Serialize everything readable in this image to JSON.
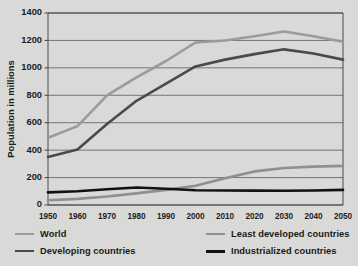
{
  "top_partial_title": "",
  "chart_data": {
    "type": "line",
    "title": "",
    "xlabel": "",
    "ylabel": "Population in millions",
    "x": [
      1950,
      1960,
      1970,
      1980,
      1990,
      2000,
      2010,
      2020,
      2030,
      2040,
      2050
    ],
    "xtick_labels": [
      "1950",
      "1960",
      "1970",
      "1980",
      "1990",
      "2000",
      "2010",
      "2020",
      "2030",
      "2040",
      "2050"
    ],
    "ytick_labels": [
      "0",
      "200",
      "400",
      "600",
      "800",
      "1000",
      "1200",
      "1400"
    ],
    "yticks": [
      0,
      200,
      400,
      600,
      800,
      1000,
      1200,
      1400
    ],
    "ylim": [
      0,
      1400
    ],
    "xlim": [
      1950,
      2050
    ],
    "grid": true,
    "legend_position": "bottom",
    "series": [
      {
        "name": "World",
        "color": "#9b9b9b",
        "width": 2.6,
        "values": [
          490,
          575,
          800,
          930,
          1050,
          1185,
          1200,
          1230,
          1265,
          1230,
          1190
        ]
      },
      {
        "name": "Developing countries",
        "color": "#4a4a4a",
        "width": 2.6,
        "values": [
          350,
          405,
          590,
          760,
          885,
          1010,
          1060,
          1100,
          1135,
          1105,
          1060
        ]
      },
      {
        "name": "Least developed countries",
        "color": "#8f8f8f",
        "width": 2.6,
        "values": [
          35,
          45,
          62,
          85,
          110,
          140,
          195,
          245,
          270,
          280,
          285
        ]
      },
      {
        "name": "Industrialized countries",
        "color": "#121212",
        "width": 2.6,
        "values": [
          92,
          100,
          115,
          128,
          118,
          108,
          106,
          105,
          104,
          106,
          110
        ]
      }
    ]
  },
  "legend": {
    "items": [
      {
        "label": "World",
        "color": "#9b9b9b"
      },
      {
        "label": "Least developed countries",
        "color": "#8f8f8f"
      },
      {
        "label": "Developing countries",
        "color": "#4a4a4a"
      },
      {
        "label": "Industrialized countries",
        "color": "#121212"
      }
    ]
  },
  "colors": {
    "background": "#d9d9d7",
    "plot_background": "#d9d9d7",
    "axis": "#3a3a3a",
    "grid": "#4a4a4a",
    "text": "#1a1a1a"
  }
}
